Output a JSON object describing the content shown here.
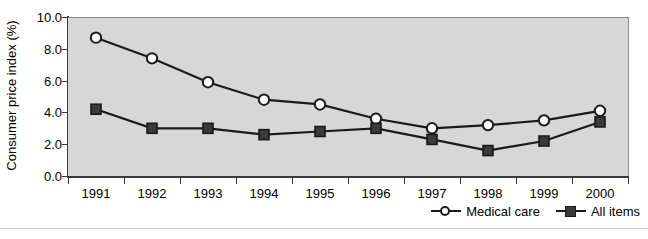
{
  "chart_data": {
    "type": "line",
    "title": "",
    "subtitle": "",
    "xlabel": "",
    "ylabel": "Consumer price index (%)",
    "categories": [
      "1991",
      "1992",
      "1993",
      "1994",
      "1995",
      "1996",
      "1997",
      "1998",
      "1999",
      "2000"
    ],
    "x": [
      1991,
      1992,
      1993,
      1994,
      1995,
      1996,
      1997,
      1998,
      1999,
      2000
    ],
    "ylim": [
      0.0,
      10.0
    ],
    "yticks": [
      "0.0",
      "2.0",
      "4.0",
      "6.0",
      "8.0",
      "10.0"
    ],
    "ytick_values": [
      0.0,
      2.0,
      4.0,
      6.0,
      8.0,
      10.0
    ],
    "grid": false,
    "legend_position": "bottom-right",
    "series": [
      {
        "name": "Medical care",
        "marker": "open-circle",
        "color": "#1a1a1a",
        "marker_fill": "#ffffff",
        "values": [
          8.7,
          7.4,
          5.9,
          4.8,
          4.5,
          3.6,
          3.0,
          3.2,
          3.5,
          4.1
        ]
      },
      {
        "name": "All items",
        "marker": "filled-square",
        "color": "#1a1a1a",
        "marker_fill": "#3a3a3a",
        "values": [
          4.2,
          3.0,
          3.0,
          2.6,
          2.8,
          3.0,
          2.3,
          1.6,
          2.2,
          3.4
        ]
      }
    ]
  },
  "legend": {
    "entries": [
      {
        "label": "Medical care",
        "marker": "open-circle"
      },
      {
        "label": "All items",
        "marker": "filled-square"
      }
    ]
  },
  "style": {
    "plot_background": "#d7d7d7",
    "page_background": "#ffffff",
    "axis_color": "#3b3b3b",
    "line_color": "#1a1a1a"
  }
}
